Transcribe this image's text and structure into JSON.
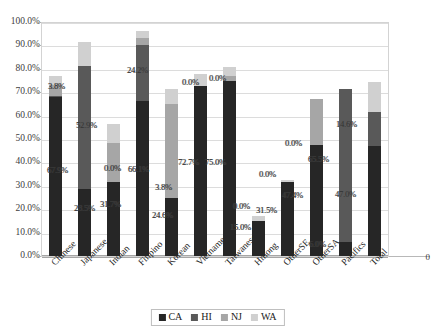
{
  "chart_data": {
    "type": "bar",
    "subtype": "stacked-bar",
    "title": "",
    "xlabel": "",
    "ylabel": "",
    "ylim": [
      0,
      100
    ],
    "ytick_labels": [
      "0.0%",
      "10.0%",
      "20.0%",
      "30.0%",
      "40.0%",
      "50.0%",
      "60.0%",
      "70.0%",
      "80.0%",
      "90.0%",
      "100.0%"
    ],
    "ytick_values": [
      0,
      10,
      20,
      30,
      40,
      50,
      60,
      70,
      80,
      90,
      100
    ],
    "grid": true,
    "legend_position": "bottom",
    "axis_right_label": "0",
    "categories": [
      "Chinese",
      "Japanese",
      "Indian",
      "Filipino",
      "Korean",
      "Vietnamese",
      "Taiwanese",
      "Hmong",
      "OtherSE",
      "OtherSA",
      "Pacifics",
      "Total"
    ],
    "series": [
      {
        "name": "CA",
        "color": "#262626",
        "values": [
          67.9,
          28.5,
          31.7,
          66.1,
          24.6,
          72.7,
          75.0,
          15.0,
          31.5,
          47.4,
          6.0,
          47.0
        ]
      },
      {
        "name": "HI",
        "color": "#595959",
        "values": [
          0.7,
          52.9,
          0.0,
          24.2,
          0.0,
          0.0,
          0.0,
          0.0,
          0.0,
          0.0,
          65.5,
          14.6
        ]
      },
      {
        "name": "NJ",
        "color": "#a6a6a6",
        "values": [
          4.6,
          0.0,
          16.5,
          2.7,
          40.4,
          0.0,
          1.9,
          0.0,
          0.0,
          19.7,
          0.0,
          0.0
        ]
      },
      {
        "name": "WA",
        "color": "#d0d0d0",
        "values": [
          3.8,
          9.9,
          8.4,
          3.1,
          6.5,
          5.0,
          4.0,
          2.0,
          1.2,
          0.0,
          0.0,
          12.7
        ]
      }
    ],
    "data_labels": [
      {
        "category": "Chinese",
        "text": "67.9%",
        "series": "CA",
        "x": 47,
        "y": 166
      },
      {
        "category": "Chinese",
        "text": "3.8%",
        "series": "WA",
        "x": 48,
        "y": 82
      },
      {
        "category": "Japanese",
        "text": "28.5%",
        "series": "CA",
        "x": 74,
        "y": 204
      },
      {
        "category": "Japanese",
        "text": "52.9%",
        "series": "HI",
        "x": 76,
        "y": 121
      },
      {
        "category": "Indian",
        "text": "31.7%",
        "series": "CA",
        "x": 100,
        "y": 200
      },
      {
        "category": "Indian",
        "text": "0.0%",
        "series": "HI",
        "x": 104,
        "y": 164
      },
      {
        "category": "Filipino",
        "text": "66.1%",
        "series": "CA",
        "x": 128,
        "y": 165
      },
      {
        "category": "Filipino",
        "text": "24.2%",
        "series": "HI",
        "x": 127,
        "y": 66
      },
      {
        "category": "Korean",
        "text": "24.6%",
        "series": "CA",
        "x": 152,
        "y": 211
      },
      {
        "category": "Korean",
        "text": "3.8%",
        "series": "NJ",
        "x": 155,
        "y": 183
      },
      {
        "category": "Vietnamese",
        "text": "72.7%",
        "series": "CA",
        "x": 178,
        "y": 158
      },
      {
        "category": "Vietnamese",
        "text": "0.0%",
        "series": "WA",
        "x": 182,
        "y": 78
      },
      {
        "category": "Taiwanese",
        "text": "75.0%",
        "series": "CA",
        "x": 205,
        "y": 158
      },
      {
        "category": "Taiwanese",
        "text": "0.0%",
        "series": "WA",
        "x": 209,
        "y": 74
      },
      {
        "category": "Hmong",
        "text": "15.0%",
        "series": "CA",
        "x": 230,
        "y": 223
      },
      {
        "category": "Hmong",
        "text": "0.0%",
        "series": "WA",
        "x": 233,
        "y": 202
      },
      {
        "category": "OtherSE",
        "text": "31.5%",
        "series": "CA",
        "x": 256,
        "y": 206
      },
      {
        "category": "OtherSE",
        "text": "0.0%",
        "series": "WA",
        "x": 259,
        "y": 170
      },
      {
        "category": "OtherSA",
        "text": "47.4%",
        "series": "CA",
        "x": 282,
        "y": 191
      },
      {
        "category": "OtherSA",
        "text": "0.0%",
        "series": "NJ",
        "x": 285,
        "y": 139
      },
      {
        "category": "Pacifics",
        "text": "6.0%",
        "series": "CA",
        "x": 309,
        "y": 240
      },
      {
        "category": "Pacifics",
        "text": "65.5%",
        "series": "HI",
        "x": 308,
        "y": 155
      },
      {
        "category": "Total",
        "text": "47.0%",
        "series": "CA",
        "x": 335,
        "y": 190
      },
      {
        "category": "Total",
        "text": "14.6%",
        "series": "HI",
        "x": 336,
        "y": 120
      }
    ]
  },
  "legend": {
    "items": [
      {
        "label": "CA",
        "swatch": "sw-ca"
      },
      {
        "label": "HI",
        "swatch": "sw-hi"
      },
      {
        "label": "NJ",
        "swatch": "sw-nj"
      },
      {
        "label": "WA",
        "swatch": "sw-wa"
      }
    ]
  }
}
